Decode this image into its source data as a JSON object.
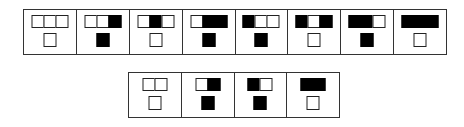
{
  "figure": {
    "colors": {
      "filled": "#000000",
      "empty": "#ffffff",
      "stroke": "#222222"
    },
    "top_row": [
      {
        "cap": [
          0,
          0,
          0
        ],
        "stem": 0
      },
      {
        "cap": [
          0,
          0,
          1
        ],
        "stem": 1
      },
      {
        "cap": [
          0,
          1,
          0
        ],
        "stem": 0
      },
      {
        "cap": [
          0,
          1,
          1
        ],
        "stem": 1
      },
      {
        "cap": [
          1,
          0,
          0
        ],
        "stem": 1
      },
      {
        "cap": [
          1,
          0,
          1
        ],
        "stem": 0
      },
      {
        "cap": [
          1,
          1,
          0
        ],
        "stem": 1
      },
      {
        "cap": [
          1,
          1,
          1
        ],
        "stem": 0
      }
    ],
    "bottom_row": [
      {
        "cap": [
          0,
          0
        ],
        "stem": 0
      },
      {
        "cap": [
          0,
          1
        ],
        "stem": 1
      },
      {
        "cap": [
          1,
          0
        ],
        "stem": 1
      },
      {
        "cap": [
          1,
          1
        ],
        "stem": 0
      }
    ]
  }
}
